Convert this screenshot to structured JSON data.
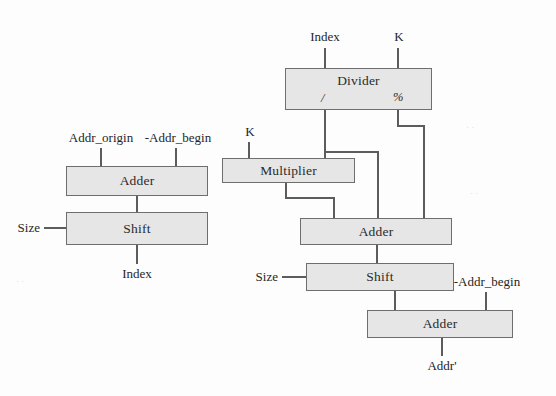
{
  "diagram": {
    "colors": {
      "box_fill": "#e6e6e6",
      "box_stroke": "#6e6e6e",
      "wire": "#5c5c5c",
      "text": "#2b2b2b",
      "background": "#fdfdfd"
    },
    "left_group": {
      "inputs": [
        {
          "id": "addr_origin",
          "label": "Addr_origin"
        },
        {
          "id": "neg_addr_begin",
          "label": "-Addr_begin"
        },
        {
          "id": "size",
          "label": "Size"
        }
      ],
      "nodes": [
        {
          "id": "l_adder",
          "label": "Adder"
        },
        {
          "id": "l_shift",
          "label": "Shift"
        }
      ],
      "outputs": [
        {
          "id": "index_out",
          "label": "Index"
        }
      ]
    },
    "right_group": {
      "inputs": [
        {
          "id": "index_in",
          "label": "Index"
        },
        {
          "id": "k_divider",
          "label": "K"
        },
        {
          "id": "k_multiplier",
          "label": "K"
        },
        {
          "id": "size_right",
          "label": "Size"
        },
        {
          "id": "neg_addr_begin_right",
          "label": "-Addr_begin"
        }
      ],
      "nodes": [
        {
          "id": "r_divider",
          "label": "Divider",
          "ports": [
            {
              "id": "quotient",
              "label": "/"
            },
            {
              "id": "remainder",
              "label": "%"
            }
          ]
        },
        {
          "id": "r_multiplier",
          "label": "Multiplier"
        },
        {
          "id": "r_adder_mid",
          "label": "Adder"
        },
        {
          "id": "r_shift",
          "label": "Shift"
        },
        {
          "id": "r_adder_bottom",
          "label": "Adder"
        }
      ],
      "outputs": [
        {
          "id": "addr_prime",
          "label": "Addr'"
        }
      ]
    }
  }
}
